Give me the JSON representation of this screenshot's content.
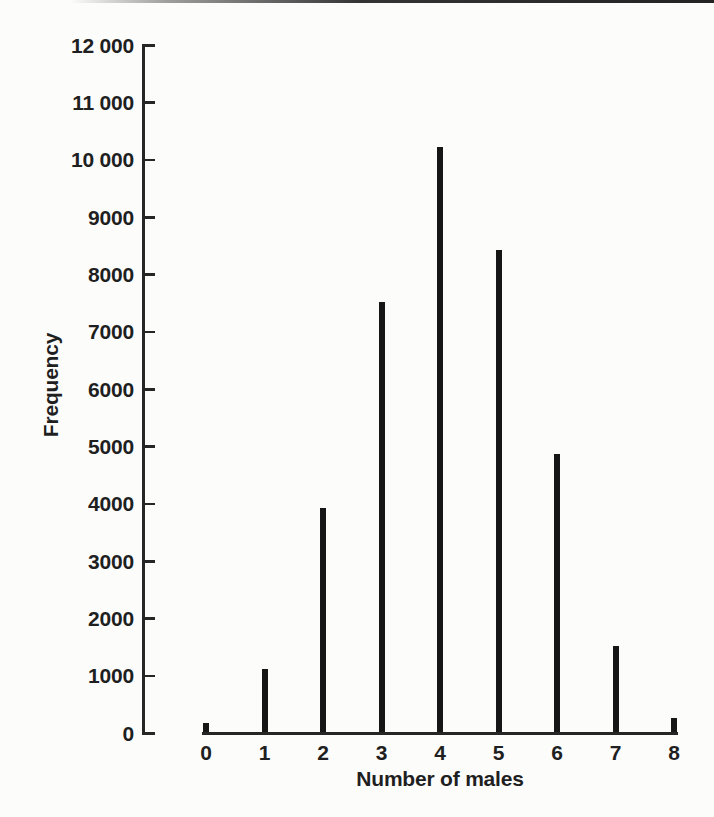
{
  "page": {
    "background": "#fcfcfb",
    "top_edge_line_color": "#2b2b2b"
  },
  "chart_data": {
    "type": "bar",
    "title": "",
    "xlabel": "Number of males",
    "ylabel": "Frequency",
    "categories": [
      "0",
      "1",
      "2",
      "3",
      "4",
      "5",
      "6",
      "7",
      "8"
    ],
    "values": [
      150,
      1100,
      3900,
      7500,
      10200,
      8400,
      4850,
      1500,
      250
    ],
    "ylim": [
      0,
      12000
    ],
    "y_tick_step": 1000,
    "y_tick_labels": [
      "0",
      "1000",
      "2000",
      "3000",
      "4000",
      "5000",
      "6000",
      "7000",
      "8000",
      "9000",
      "10 000",
      "11 000",
      "12 000"
    ],
    "x_tick_labels": [
      "0",
      "1",
      "2",
      "3",
      "4",
      "5",
      "6",
      "7",
      "8"
    ],
    "bar_style": "thin-stick",
    "bar_color": "#161616",
    "axis_color": "#262626",
    "text_color": "#1f1f1f",
    "grid": false,
    "legend": false,
    "ticks_direction": "inward-right"
  }
}
